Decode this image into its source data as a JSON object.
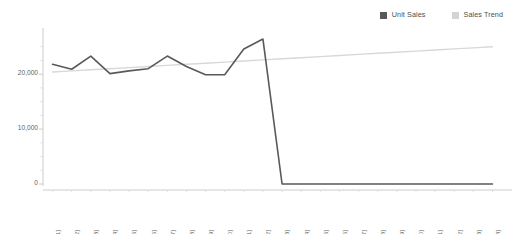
{
  "legend": {
    "position": "top-right",
    "entries": [
      {
        "label": "Unit Sales",
        "color": "#595959",
        "swatch": "square"
      },
      {
        "label": "Sales Trend",
        "color": "#d4d4d4",
        "swatch": "square"
      }
    ]
  },
  "axes": {
    "y": {
      "ticks": [
        {
          "label": "20,000",
          "value": 20000
        },
        {
          "label": "10,000",
          "value": 10000
        },
        {
          "label": "0",
          "value": 0
        }
      ],
      "min": 0,
      "max": 27500,
      "minor_ticks": [
        25000,
        22500,
        17500,
        15000,
        12500,
        7500,
        5000,
        2500
      ]
    },
    "x": {
      "labels": [
        "1 [1]",
        "2 [2]",
        "3 [3]",
        "4 [4]",
        "5 [5]",
        "6 [6]",
        "7 [7]",
        "8 [8]",
        "9 [9]",
        "10 [10]",
        "11 [11]",
        "12 [12]",
        "1 [13]",
        "2 [14]",
        "3 [15]",
        "4 [16]",
        "5 [17]",
        "6 [18]",
        "7 [19]",
        "8 [20]",
        "9 [21]",
        "10 [22]",
        "11 [23]",
        "12 [24]"
      ],
      "rotation": -90
    }
  },
  "colors": {
    "unit_sales_line": "#595959",
    "sales_trend_line": "#d8d8d8",
    "axis_line": "#cccccc",
    "tick_mark": "#cccccc",
    "text": "#5f5f5f",
    "background": "#ffffff"
  },
  "chart_data": {
    "type": "line",
    "title": "",
    "xlabel": "",
    "ylabel": "",
    "ylim": [
      0,
      27500
    ],
    "grid": false,
    "legend_position": "top-right",
    "categories": [
      "1 [1]",
      "2 [2]",
      "3 [3]",
      "4 [4]",
      "5 [5]",
      "6 [6]",
      "7 [7]",
      "8 [8]",
      "9 [9]",
      "10 [10]",
      "11 [11]",
      "12 [12]",
      "1 [13]",
      "2 [14]",
      "3 [15]",
      "4 [16]",
      "5 [17]",
      "6 [18]",
      "7 [19]",
      "8 [20]",
      "9 [21]",
      "10 [22]",
      "11 [23]",
      "12 [24]"
    ],
    "series": [
      {
        "name": "Unit Sales",
        "color": "#595959",
        "values": [
          21800,
          20900,
          23300,
          20100,
          20600,
          21000,
          23300,
          21400,
          19900,
          19900,
          24600,
          26400,
          0,
          0,
          0,
          0,
          0,
          0,
          0,
          0,
          0,
          0,
          0,
          0
        ]
      },
      {
        "name": "Sales Trend",
        "color": "#d8d8d8",
        "values": [
          20400,
          20600,
          20800,
          21000,
          21200,
          21400,
          21600,
          21800,
          22000,
          22200,
          22400,
          22600,
          22800,
          23000,
          23200,
          23400,
          23600,
          23800,
          24000,
          24200,
          24400,
          24600,
          24800,
          25000
        ]
      }
    ]
  }
}
